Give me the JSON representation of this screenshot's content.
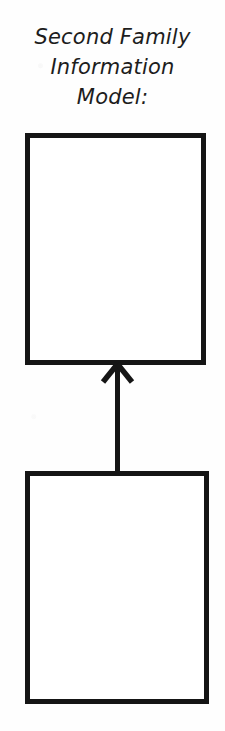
{
  "diagram": {
    "title": {
      "lines": [
        "Second Family",
        "Information",
        "Model:"
      ],
      "full_text": "Second Family Information Model:"
    },
    "colors": {
      "background": "#fefefe",
      "ink": "#151515",
      "text": "#1d1d1d"
    },
    "nodes": [
      {
        "id": "parent",
        "label": "",
        "shape": "rectangle",
        "filled": false
      },
      {
        "id": "child",
        "label": "",
        "shape": "rectangle",
        "filled": false
      }
    ],
    "connectors": [
      {
        "id": "generalization",
        "from": "child",
        "to": "parent",
        "style": "solid-line",
        "arrowhead": "open-v",
        "direction": "up"
      }
    ]
  }
}
